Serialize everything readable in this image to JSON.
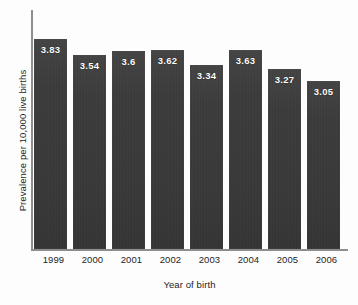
{
  "chart_data": {
    "type": "bar",
    "title": "",
    "xlabel": "Year of birth",
    "ylabel": "Prevalence per 10,000 live births",
    "categories": [
      "1999",
      "2000",
      "2001",
      "2002",
      "2003",
      "2004",
      "2005",
      "2006"
    ],
    "values": [
      3.83,
      3.54,
      3.6,
      3.62,
      3.34,
      3.63,
      3.27,
      3.05
    ],
    "value_labels": [
      "3.83",
      "3.54",
      "3.6",
      "3.62",
      "3.34",
      "3.63",
      "3.27",
      "3.05"
    ],
    "ylim": [
      0,
      4.35
    ],
    "grid": false,
    "legend": null,
    "bar_color": "#3b3b3b",
    "label_color": "#ffffff",
    "axis_color": "#8e8e8e"
  }
}
